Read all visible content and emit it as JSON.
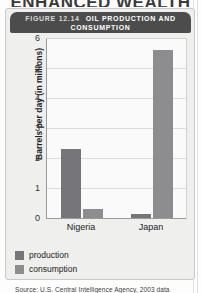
{
  "page": {
    "heading": "ENHANCED WEALTH"
  },
  "figure": {
    "number_label": "FIGURE 12.14",
    "title_line1": "OIL PRODUCTION AND",
    "title_line2": "CONSUMPTION",
    "source": "Source: U.S. Central Intelligence Agency, 2003 data"
  },
  "legend": {
    "items": [
      {
        "label": "production",
        "color": "#76767a"
      },
      {
        "label": "consumption",
        "color": "#8d8d90"
      }
    ]
  },
  "axis": {
    "y_ticks": [
      "6",
      "5",
      "4",
      "3",
      "2",
      "1",
      "0"
    ],
    "x_ticks": [
      "Nigeria",
      "Japan"
    ]
  },
  "colors": {
    "bar": "#7d7d80",
    "titlebar": "#4c4c4c",
    "card": "#efefee",
    "plot_bg": "#fafafa",
    "grid": "#dcdcda"
  },
  "chart_data": {
    "type": "bar",
    "title": "OIL PRODUCTION AND CONSUMPTION",
    "subtitle": "FIGURE 12.14",
    "xlabel": "",
    "ylabel": "Barrels per day (in millions)",
    "ylim": [
      0,
      6
    ],
    "yticks": [
      0,
      1,
      2,
      3,
      4,
      5,
      6
    ],
    "grid": true,
    "legend_position": "bottom-left",
    "categories": [
      "Nigeria",
      "Japan"
    ],
    "series": [
      {
        "name": "production",
        "values": [
          2.3,
          0.12
        ]
      },
      {
        "name": "consumption",
        "values": [
          0.3,
          5.6
        ]
      }
    ],
    "source": "Source: U.S. Central Intelligence Agency, 2003 data"
  }
}
